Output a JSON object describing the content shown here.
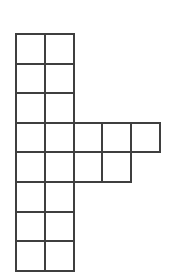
{
  "canvas": {
    "width_px": 172,
    "height_px": 277,
    "background_color": "#ffffff"
  },
  "figure": {
    "square_count": 21,
    "line_color": "#3f3f3f",
    "line_width_px": 2,
    "fill_color": "#ffffff",
    "grid": {
      "rows": 8,
      "cols": 5,
      "origin_x_px": 15,
      "origin_y_px": 33,
      "cell_width_px": 28.8,
      "cell_height_px": 29.6,
      "matrix": [
        [
          1,
          1,
          0,
          0,
          0
        ],
        [
          1,
          1,
          0,
          0,
          0
        ],
        [
          1,
          1,
          0,
          0,
          0
        ],
        [
          1,
          1,
          1,
          1,
          1
        ],
        [
          1,
          1,
          1,
          1,
          0
        ],
        [
          1,
          1,
          0,
          0,
          0
        ],
        [
          1,
          1,
          0,
          0,
          0
        ],
        [
          1,
          1,
          0,
          0,
          0
        ]
      ],
      "row_cell_counts": [
        2,
        2,
        2,
        5,
        4,
        2,
        2,
        2
      ]
    }
  }
}
